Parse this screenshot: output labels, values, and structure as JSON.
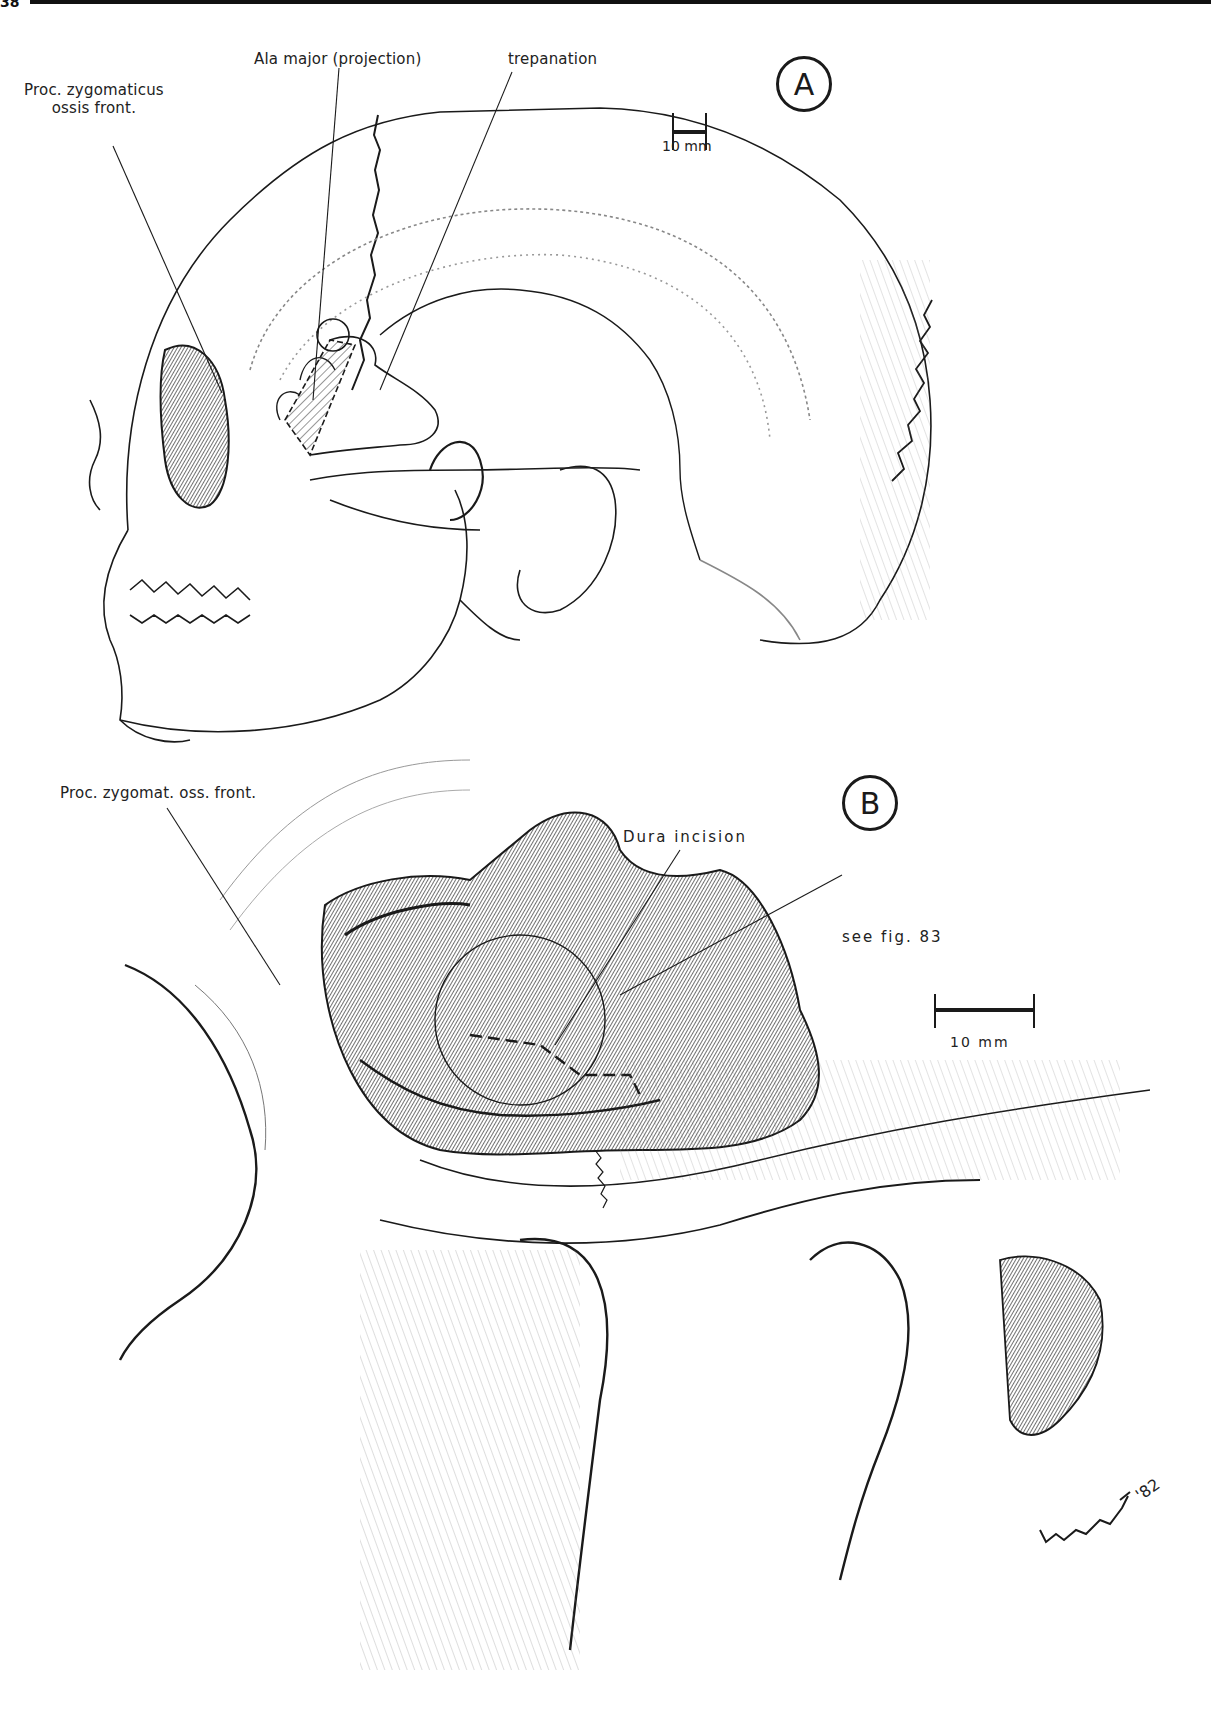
{
  "page": {
    "page_number_fragment": "38"
  },
  "panel_a": {
    "badge": "A",
    "labels": {
      "proc_zygomaticus_line1": "Proc. zygomaticus",
      "proc_zygomaticus_line2": "ossis front.",
      "ala_major": "Ala major (projection)",
      "trepanation": "trepanation"
    },
    "scale_bar": {
      "label": "10 mm"
    }
  },
  "panel_b": {
    "badge": "B",
    "labels": {
      "proc_zygomat": "Proc. zygomat. oss. front.",
      "dura_incision": "Dura incision",
      "see_fig": "see fig. 83"
    },
    "scale_bar": {
      "label": "10 mm"
    },
    "signature": "'82"
  },
  "colors": {
    "ink": "#1a1a1a",
    "paper": "#ffffff"
  }
}
